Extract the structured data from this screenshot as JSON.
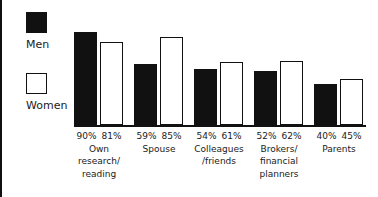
{
  "chart_data": {
    "type": "bar",
    "title": "",
    "subtitle": "",
    "xlabel": "",
    "ylabel": "",
    "ylim": [
      0,
      100
    ],
    "grid": false,
    "legend_position": "left",
    "value_suffix": "%",
    "categories": [
      "Own\nresearch/\nreading",
      "Spouse",
      "Colleagues\n/friends",
      "Brokers/\nfinancial\nplanners",
      "Parents"
    ],
    "series": [
      {
        "name": "Men",
        "values": [
          90,
          59,
          54,
          52,
          40
        ],
        "color": "#111111",
        "style": "filled"
      },
      {
        "name": "Women",
        "values": [
          81,
          85,
          61,
          62,
          45
        ],
        "color": "#ffffff",
        "style": "outlined"
      }
    ],
    "data_labels": [
      {
        "men": "90%",
        "women": "81%"
      },
      {
        "men": "59%",
        "women": "85%"
      },
      {
        "men": "54%",
        "women": "61%"
      },
      {
        "men": "52%",
        "women": "62%"
      },
      {
        "men": "40%",
        "women": "45%"
      }
    ]
  },
  "legend": {
    "entries": [
      {
        "label": "Men",
        "swatch": "filled-square-icon"
      },
      {
        "label": "Women",
        "swatch": "hollow-square-icon"
      }
    ]
  },
  "groups": [
    {
      "pct_men": "90%",
      "pct_women": "81%",
      "cat_line1": "Own",
      "cat_line2": "research/",
      "cat_line3": "reading"
    },
    {
      "pct_men": "59%",
      "pct_women": "85%",
      "cat_line1": "Spouse",
      "cat_line2": "",
      "cat_line3": ""
    },
    {
      "pct_men": "54%",
      "pct_women": "61%",
      "cat_line1": "Colleagues",
      "cat_line2": "/friends",
      "cat_line3": ""
    },
    {
      "pct_men": "52%",
      "pct_women": "62%",
      "cat_line1": "Brokers/",
      "cat_line2": "financial",
      "cat_line3": "planners"
    },
    {
      "pct_men": "40%",
      "pct_women": "45%",
      "cat_line1": "Parents",
      "cat_line2": "",
      "cat_line3": ""
    }
  ],
  "colors": {
    "men_fill": "#111111",
    "women_fill": "#ffffff",
    "outline": "#111111",
    "text": "#1a1a1a",
    "background": "#ffffff"
  }
}
